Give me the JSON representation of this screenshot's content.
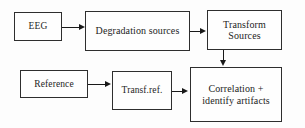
{
  "diagram": {
    "canvas": {
      "width": 305,
      "height": 128
    },
    "colors": {
      "background": "#fdfdfd",
      "node_fill": "#fefefe",
      "node_border": "#2e2e2e",
      "edge": "#191919",
      "text": "#1d1d1d"
    },
    "nodes": [
      {
        "id": "eeg",
        "label": "EEG"
      },
      {
        "id": "degrad",
        "label": "Degradation sources"
      },
      {
        "id": "transform",
        "label": "Transform\nSources"
      },
      {
        "id": "reference",
        "label": "Reference"
      },
      {
        "id": "transfref",
        "label": "Transf.ref."
      },
      {
        "id": "correl",
        "label": "Correlation +\nidentify artifacts"
      }
    ],
    "edges": [
      {
        "id": "eeg-degrad",
        "from": "eeg",
        "to": "degrad",
        "direction": "right"
      },
      {
        "id": "degrad-transform",
        "from": "degrad",
        "to": "transform",
        "direction": "right"
      },
      {
        "id": "transform-correl",
        "from": "transform",
        "to": "correl",
        "direction": "down"
      },
      {
        "id": "reference-transfref",
        "from": "reference",
        "to": "transfref",
        "direction": "right"
      },
      {
        "id": "transfref-correl",
        "from": "transfref",
        "to": "correl",
        "direction": "right"
      }
    ]
  }
}
